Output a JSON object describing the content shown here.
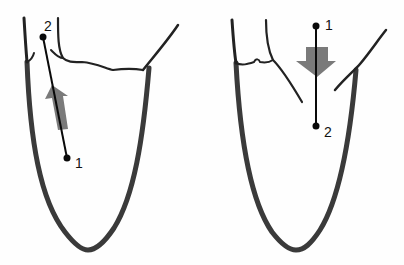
{
  "diagram": {
    "panels": [
      {
        "id": "left",
        "description": "Ventricle outline with measurement line from point 1 (lower, inside cavity) to point 2 (upper, near base); gray arrow pointing upward",
        "points": [
          {
            "label": "1",
            "x": 67,
            "y": 158
          },
          {
            "label": "2",
            "x": 43,
            "y": 37
          }
        ],
        "arrow_direction": "up"
      },
      {
        "id": "right",
        "description": "Ventricle outline with measurement line from point 1 (upper, above base) to point 2 (lower, inside cavity); gray arrow pointing downward",
        "points": [
          {
            "label": "1",
            "x": 316,
            "y": 26
          },
          {
            "label": "2",
            "x": 316,
            "y": 126
          }
        ],
        "arrow_direction": "down"
      }
    ],
    "colors": {
      "wall": "#3a3a3a",
      "line": "#0a0a0a",
      "arrow": "#7a7a7a",
      "background": "#fefefe"
    }
  }
}
